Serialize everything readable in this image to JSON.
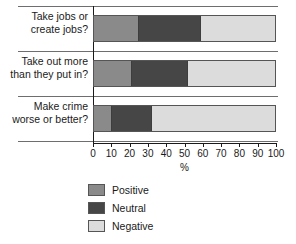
{
  "chart_data": {
    "type": "bar",
    "orientation": "horizontal",
    "stacked": true,
    "stack_total": 100,
    "title": "",
    "xlabel": "%",
    "ylabel": "",
    "xlim": [
      0,
      100
    ],
    "grid": false,
    "legend_position": "bottom",
    "categories": [
      "Take jobs or\ncreate jobs?",
      "Take out more\nthan they put in?",
      "Make crime\nworse or better?"
    ],
    "xticks": [
      0,
      10,
      20,
      30,
      40,
      50,
      60,
      70,
      80,
      90,
      100
    ],
    "xticklabels": [
      "0",
      "10",
      "20",
      "30",
      "40",
      "50",
      "60",
      "70",
      "80",
      "90",
      "100"
    ],
    "series": [
      {
        "name": "Positive",
        "color": "#8a8a8a",
        "values": [
          25,
          21,
          10
        ]
      },
      {
        "name": "Neutral",
        "color": "#464646",
        "values": [
          34,
          31,
          22
        ]
      },
      {
        "name": "Negative",
        "color": "#dcdcdc",
        "values": [
          41,
          48,
          68
        ]
      }
    ],
    "cumulative_boundaries": [
      [
        25,
        59
      ],
      [
        21,
        52
      ],
      [
        10,
        32
      ]
    ]
  },
  "legend": {
    "items": [
      {
        "label": "Positive",
        "color": "#8a8a8a"
      },
      {
        "label": "Neutral",
        "color": "#464646"
      },
      {
        "label": "Negative",
        "color": "#dcdcdc"
      }
    ]
  }
}
